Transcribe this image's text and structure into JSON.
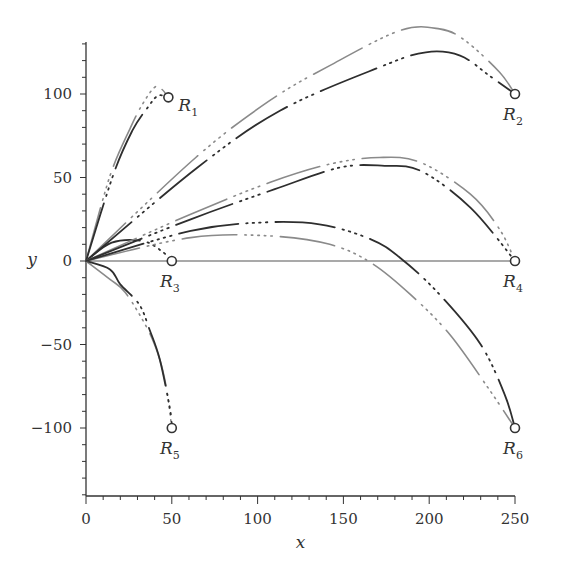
{
  "chart_data": {
    "type": "line",
    "title": "",
    "xlabel": "x",
    "ylabel": "y",
    "xlim": [
      0,
      250
    ],
    "ylim": [
      -140,
      131
    ],
    "grid": false,
    "legend": "none",
    "x_ticks": [
      0,
      50,
      100,
      150,
      200,
      250
    ],
    "x_tick_labels": [
      "0",
      "50",
      "100",
      "150",
      "200",
      "250"
    ],
    "y_ticks": [
      -100,
      -50,
      0,
      50,
      100
    ],
    "y_tick_labels": [
      "−100",
      "−50",
      "0",
      "50",
      "100"
    ],
    "x_minor_step": 10,
    "y_minor_step": 10,
    "reference_line": {
      "name": "y-zero-line",
      "points": [
        [
          0,
          0
        ],
        [
          250,
          0
        ]
      ],
      "color": "#555555"
    },
    "targets": [
      {
        "name": "R",
        "sub": "1",
        "x": 48,
        "y": 98,
        "label_pos": "right"
      },
      {
        "name": "R",
        "sub": "2",
        "x": 250,
        "y": 100,
        "label_pos": "below"
      },
      {
        "name": "R",
        "sub": "3",
        "x": 50,
        "y": 0,
        "label_pos": "below"
      },
      {
        "name": "R",
        "sub": "4",
        "x": 250,
        "y": 0,
        "label_pos": "below"
      },
      {
        "name": "R",
        "sub": "5",
        "x": 50,
        "y": -100,
        "label_pos": "below"
      },
      {
        "name": "R",
        "sub": "6",
        "x": 250,
        "y": -100,
        "label_pos": "below"
      }
    ],
    "series": [
      {
        "name": "R1-grey",
        "color": "#8a8a8a",
        "points": [
          [
            0,
            0
          ],
          [
            14,
            51
          ],
          [
            26,
            80
          ],
          [
            33,
            94
          ],
          [
            40,
            104
          ],
          [
            44,
            103
          ],
          [
            48,
            98
          ]
        ]
      },
      {
        "name": "R1-dark",
        "color": "#2e2e2e",
        "points": [
          [
            0,
            0
          ],
          [
            16,
            52
          ],
          [
            27,
            78
          ],
          [
            36,
            92
          ],
          [
            42,
            99
          ],
          [
            48,
            98
          ]
        ]
      },
      {
        "name": "R2-grey",
        "color": "#8a8a8a",
        "points": [
          [
            0,
            0
          ],
          [
            64,
            62
          ],
          [
            107,
            96
          ],
          [
            142,
            117
          ],
          [
            183,
            138
          ],
          [
            206,
            139
          ],
          [
            221,
            132
          ],
          [
            241,
            113
          ],
          [
            250,
            100
          ]
        ]
      },
      {
        "name": "R2-dark",
        "color": "#2e2e2e",
        "points": [
          [
            0,
            0
          ],
          [
            65,
            56
          ],
          [
            113,
            90
          ],
          [
            171,
            116
          ],
          [
            198,
            125
          ],
          [
            218,
            123
          ],
          [
            235,
            111
          ],
          [
            250,
            100
          ]
        ]
      },
      {
        "name": "R3-dark",
        "color": "#2e2e2e",
        "points": [
          [
            0,
            0
          ],
          [
            15,
            11
          ],
          [
            33,
            12
          ],
          [
            44,
            6
          ],
          [
            50,
            0
          ]
        ]
      },
      {
        "name": "R4-grey",
        "color": "#8a8a8a",
        "points": [
          [
            0,
            0
          ],
          [
            61,
            28
          ],
          [
            107,
            47
          ],
          [
            142,
            58
          ],
          [
            171,
            62
          ],
          [
            195,
            59
          ],
          [
            224,
            40
          ],
          [
            241,
            19
          ],
          [
            250,
            0
          ]
        ]
      },
      {
        "name": "R4-dark",
        "color": "#2e2e2e",
        "points": [
          [
            0,
            0
          ],
          [
            61,
            25
          ],
          [
            110,
            43
          ],
          [
            148,
            56
          ],
          [
            174,
            57
          ],
          [
            195,
            54
          ],
          [
            224,
            32
          ],
          [
            250,
            0
          ]
        ]
      },
      {
        "name": "R5-grey",
        "color": "#8a8a8a",
        "points": [
          [
            0,
            0
          ],
          [
            14,
            -11
          ],
          [
            23,
            -19
          ],
          [
            36,
            -41
          ],
          [
            43,
            -59
          ],
          [
            47,
            -77
          ],
          [
            50,
            -100
          ]
        ]
      },
      {
        "name": "R5-dark",
        "color": "#2e2e2e",
        "points": [
          [
            0,
            0
          ],
          [
            14,
            -5
          ],
          [
            20,
            -14
          ],
          [
            31,
            -26
          ],
          [
            37,
            -41
          ],
          [
            43,
            -59
          ],
          [
            49,
            -89
          ],
          [
            50,
            -100
          ]
        ]
      },
      {
        "name": "R6-grey",
        "color": "#8a8a8a",
        "points": [
          [
            0,
            0
          ],
          [
            61,
            14
          ],
          [
            107,
            15
          ],
          [
            142,
            10
          ],
          [
            166,
            -1
          ],
          [
            189,
            -20
          ],
          [
            212,
            -44
          ],
          [
            235,
            -77
          ],
          [
            250,
            -100
          ]
        ]
      },
      {
        "name": "R6-dark",
        "color": "#2e2e2e",
        "points": [
          [
            0,
            0
          ],
          [
            61,
            18
          ],
          [
            101,
            23
          ],
          [
            136,
            22
          ],
          [
            166,
            13
          ],
          [
            183,
            2
          ],
          [
            206,
            -20
          ],
          [
            230,
            -50
          ],
          [
            244,
            -80
          ],
          [
            250,
            -100
          ]
        ]
      }
    ]
  }
}
